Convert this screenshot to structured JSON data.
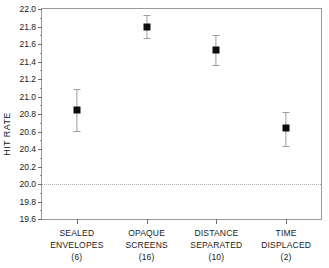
{
  "chart_data": {
    "type": "scatter",
    "title": "",
    "xlabel": "",
    "ylabel": "HIT RATE",
    "ylim": [
      19.6,
      22.0
    ],
    "ytick_step": 0.2,
    "yminor_step": 0.1,
    "grid": false,
    "legend": "none",
    "categories": [
      "SEALED ENVELOPES",
      "OPAQUE SCREENS",
      "DISTANCE SEPARATED",
      "TIME DISPLACED"
    ],
    "category_lines": [
      [
        "SEALED",
        "ENVELOPES"
      ],
      [
        "OPAQUE",
        "SCREENS"
      ],
      [
        "DISTANCE",
        "SEPARATED"
      ],
      [
        "TIME",
        "DISPLACED"
      ]
    ],
    "sample_sizes": [
      "(6)",
      "(16)",
      "(10)",
      "(2)"
    ],
    "values": [
      20.85,
      21.8,
      21.53,
      20.64
    ],
    "error_low": [
      20.61,
      21.67,
      21.36,
      20.44
    ],
    "error_high": [
      21.09,
      21.93,
      21.7,
      20.82
    ],
    "ytick_labels": [
      "19.6",
      "19.8",
      "20.0",
      "20.2",
      "20.4",
      "20.6",
      "20.8",
      "21.0",
      "21.2",
      "21.4",
      "21.6",
      "21.8",
      "22.0"
    ],
    "ytick_values": [
      19.6,
      19.8,
      20.0,
      20.2,
      20.4,
      20.6,
      20.8,
      21.0,
      21.2,
      21.4,
      21.6,
      21.8,
      22.0
    ],
    "reference_line": {
      "value": 20.0,
      "style": "dotted",
      "color": "#b0b0b0"
    },
    "marker": {
      "shape": "square",
      "color": "#0d0d0d",
      "size": 7
    },
    "errorbar": {
      "color": "#9d9d9d",
      "cap_width": 7
    },
    "frame_color": "#9a9a9a",
    "text_color": "#1a1a1a",
    "background": "#ffffff"
  }
}
